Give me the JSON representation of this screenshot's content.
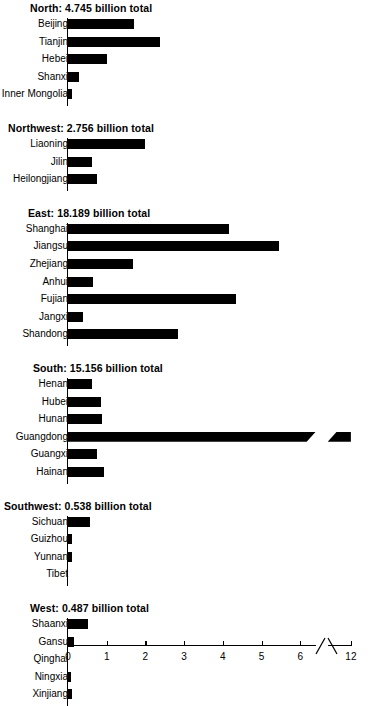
{
  "chart_data": {
    "type": "bar",
    "orientation": "horizontal",
    "title": "",
    "xlabel": "",
    "ylabel": "",
    "xlim": [
      0,
      12
    ],
    "grid": false,
    "legend": false,
    "axis_break": {
      "from": 6.4,
      "to": 11.4,
      "note": "broken axis between 6 and 12"
    },
    "xticks": [
      0,
      1,
      2,
      3,
      4,
      5,
      6,
      12
    ],
    "xtick_labels": [
      "0",
      "1",
      "2",
      "3",
      "4",
      "5",
      "6",
      "12"
    ],
    "units": "billion",
    "groups": [
      {
        "name": "North",
        "total": "4.745",
        "title": "North: 4.745 billion total",
        "categories": [
          "Beijing",
          "Tianjin",
          "Hebei",
          "Shanxi",
          "Inner Mongolia"
        ],
        "values": [
          1.7,
          2.38,
          1.0,
          0.28,
          0.1
        ]
      },
      {
        "name": "Northwest",
        "total": "2.756",
        "title": "Northwest: 2.756 billion total",
        "categories": [
          "Liaoning",
          "Jilin",
          "Heilongjiang"
        ],
        "values": [
          2.0,
          0.62,
          0.75
        ]
      },
      {
        "name": "East",
        "total": "18.189",
        "title": "East: 18.189 billion total",
        "categories": [
          "Shanghai",
          "Jiangsu",
          "Zhejiang",
          "Anhui",
          "Fujian",
          "Jangxi",
          "Shandong"
        ],
        "values": [
          4.15,
          5.45,
          1.68,
          0.65,
          4.35,
          0.4,
          2.85
        ]
      },
      {
        "name": "South",
        "total": "15.156",
        "title": "South: 15.156 billion total",
        "categories": [
          "Henan",
          "Hubei",
          "Hunan",
          "Guangdong",
          "Guangxi",
          "Hainan"
        ],
        "values": [
          0.62,
          0.85,
          0.88,
          12.0,
          0.75,
          0.93
        ],
        "broken_bar_index": 3
      },
      {
        "name": "Southwest",
        "total": "0.538",
        "title": "Southwest: 0.538 billion total",
        "categories": [
          "Sichuan",
          "Guizhou",
          "Yunnan",
          "Tibet"
        ],
        "values": [
          0.57,
          0.1,
          0.1,
          0.0
        ]
      },
      {
        "name": "West",
        "total": "0.487",
        "title": "West: 0.487 billion total",
        "categories": [
          "Shaanxi",
          "Gansu",
          "Qinghai",
          "Ningxia",
          "Xinjiang"
        ],
        "values": [
          0.52,
          0.16,
          0.0,
          0.08,
          0.1
        ]
      }
    ]
  },
  "colors": {
    "bar": "#000000",
    "axis": "#000000",
    "background": "#ffffff"
  }
}
